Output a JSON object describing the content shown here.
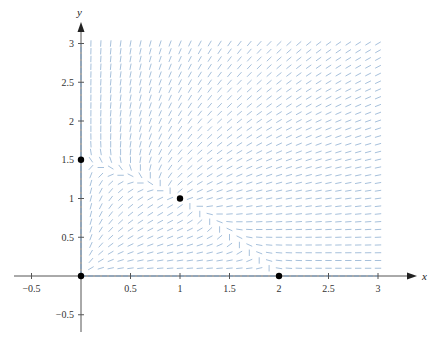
{
  "chart_data": {
    "type": "direction_field",
    "title": "",
    "xlabel": "x",
    "ylabel": "y",
    "xlim": [
      -0.6,
      3.35
    ],
    "ylim": [
      -0.75,
      3.3
    ],
    "x_ticks": [
      -0.5,
      0.5,
      1,
      1.5,
      2,
      2.5,
      3
    ],
    "x_tick_labels": [
      "−0.5",
      "0.5",
      "1",
      "1.5",
      "2",
      "2.5",
      "3"
    ],
    "y_ticks": [
      -0.5,
      0.5,
      1,
      1.5,
      2,
      2.5,
      3
    ],
    "y_tick_labels": [
      "−0.5",
      "0.5",
      "1",
      "1.5",
      "2",
      "2.5",
      "3"
    ],
    "grid": false,
    "system": {
      "dx_dt": "x(2 - x - y)",
      "dy_dt": "y(1.5 - y - 0.5x)"
    },
    "field": {
      "x_range": [
        0.1,
        3.0
      ],
      "y_range": [
        0.1,
        3.0
      ],
      "step": 0.1,
      "color": "#8fb0d2"
    },
    "equilibria": [
      {
        "x": 0,
        "y": 0
      },
      {
        "x": 0,
        "y": 1.5
      },
      {
        "x": 2,
        "y": 0
      },
      {
        "x": 1,
        "y": 1
      }
    ],
    "colors": {
      "axis": "#555555",
      "axis_overlay": "#7fa3c8",
      "point": "#000000"
    }
  }
}
